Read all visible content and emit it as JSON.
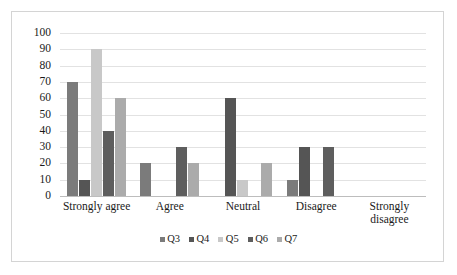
{
  "chart_data": {
    "type": "bar",
    "title": "",
    "subtitle": "",
    "xlabel": "",
    "ylabel": "",
    "ylim": [
      0,
      100
    ],
    "ytick_step": 10,
    "ytick_labels": [
      "100",
      "90",
      "80",
      "70",
      "60",
      "50",
      "40",
      "30",
      "20",
      "10",
      "0"
    ],
    "grid": true,
    "legend_position": "bottom",
    "categories": [
      "Strongly agree",
      "Agree",
      "Neutral",
      "Disagree",
      "Strongly disagree"
    ],
    "series": [
      {
        "name": "Q3",
        "color": "#7b7b7b",
        "values": [
          70,
          20,
          0,
          10,
          0
        ]
      },
      {
        "name": "Q4",
        "color": "#555555",
        "values": [
          10,
          0,
          60,
          30,
          0
        ]
      },
      {
        "name": "Q5",
        "color": "#c8c8c8",
        "values": [
          90,
          0,
          10,
          0,
          0
        ]
      },
      {
        "name": "Q6",
        "color": "#5e5e5e",
        "values": [
          40,
          30,
          0,
          30,
          0
        ]
      },
      {
        "name": "Q7",
        "color": "#ababab",
        "values": [
          60,
          20,
          20,
          0,
          0
        ]
      }
    ]
  },
  "colors": {
    "plot_background": "#ffffff",
    "gridline": "#e2e2e2",
    "axis_line": "#bdbdbd",
    "frame_border": "#d4d4d4",
    "text": "#1a1a1a"
  }
}
